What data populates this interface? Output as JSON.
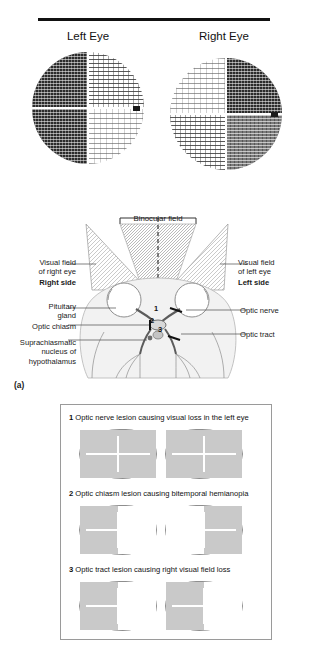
{
  "figure": {
    "eye_charts": {
      "left_label": "Left Eye",
      "right_label": "Right Eye"
    },
    "anatomy": {
      "binocular_field": "Binocular field",
      "visual_field_right_eye": "Visual field\nof right eye",
      "right_side": "Right side",
      "visual_field_left_eye": "Visual field\nof left eye",
      "left_side": "Left side",
      "pituitary_gland": "Pituitary\ngland",
      "optic_chiasm": "Optic chiasm",
      "suprachiasmatic": "Suprachiasmatic\nnucleus of\nhypothalamus",
      "optic_nerve": "Optic nerve",
      "optic_tract": "Optic tract",
      "markers": [
        "1",
        "2",
        "3"
      ],
      "panel_label": "(a)"
    },
    "lesions": [
      {
        "number": "1",
        "text": "Optic nerve lesion causing visual loss in the left eye",
        "left_blob": "grey-full",
        "right_blob": "grey-full"
      },
      {
        "number": "2",
        "text": "Optic chiasm lesion causing bitemporal hemianopia",
        "left_blob": "grey-left-half",
        "right_blob": "grey-right-half"
      },
      {
        "number": "3",
        "text": "Optic tract lesion causing right visual field loss",
        "left_blob": "grey-left-half",
        "right_blob": "grey-left-half"
      }
    ],
    "colors": {
      "rule": "#111111",
      "blob_grey": "#c9c9c9",
      "blob_outline": "#8e8e8e",
      "panel_border": "#9a9a9a",
      "field_hatch": "#b9b9b9"
    }
  }
}
